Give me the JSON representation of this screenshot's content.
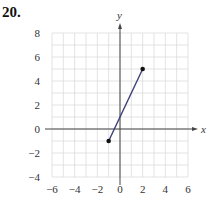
{
  "problem_number": "20.",
  "chart_data": {
    "type": "line",
    "title": "",
    "xlabel": "x",
    "ylabel": "y",
    "xlim": [
      -6,
      6
    ],
    "ylim": [
      -4,
      8
    ],
    "grid": true,
    "grid_step": 1,
    "x_ticks": [
      -6,
      -4,
      -2,
      0,
      2,
      4,
      6
    ],
    "y_ticks": [
      8,
      6,
      4,
      2,
      0,
      -2,
      -4
    ],
    "x_tick_labels": [
      "−6",
      "−4",
      "−2",
      "0",
      "2",
      "4",
      "6"
    ],
    "y_tick_labels": [
      "8",
      "6",
      "4",
      "2",
      "0",
      "−2",
      "−4"
    ],
    "series": [
      {
        "name": "segment",
        "points": [
          [
            -1,
            -1
          ],
          [
            2,
            5
          ]
        ],
        "endpoints": "closed-dots",
        "color": "#3b3f78"
      }
    ]
  },
  "colors": {
    "grid": "#dcdcdc",
    "axis": "#444444",
    "line": "#3b3f78",
    "dot": "#111111"
  }
}
